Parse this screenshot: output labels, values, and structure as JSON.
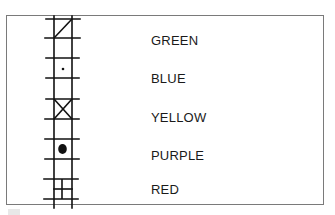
{
  "diagram": {
    "type": "ladder-symbol-legend",
    "frame_color": "#7a7a7a",
    "ink_color": "#111111",
    "legend": [
      {
        "symbol": "diagonal-slash",
        "label": "GREEN"
      },
      {
        "symbol": "small-dot",
        "label": "BLUE"
      },
      {
        "symbol": "x-cross",
        "label": "YELLOW"
      },
      {
        "symbol": "filled-circle",
        "label": "PURPLE"
      },
      {
        "symbol": "grid-four-squares",
        "label": "RED"
      }
    ]
  }
}
